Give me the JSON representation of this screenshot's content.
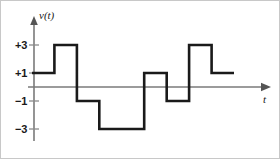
{
  "chart_data": {
    "type": "line",
    "subtype": "step-waveform",
    "title": "",
    "xlabel": "t",
    "ylabel": "v(t)",
    "y_tick_labels": [
      "+3",
      "+1",
      "−1",
      "−3"
    ],
    "y_tick_values": [
      3,
      1,
      -1,
      -3
    ],
    "ylim": [
      -4.2,
      4.2
    ],
    "xlim": [
      0,
      8.9
    ],
    "grid": false,
    "legend": null,
    "axis_style": "two-axis-arrows",
    "x_breakpoints": [
      0,
      1,
      2,
      3,
      4,
      5,
      6,
      7,
      8
    ],
    "values": [
      1,
      3,
      -1,
      -3,
      1,
      -1,
      3,
      1
    ],
    "series": [
      {
        "name": "v(t)",
        "color": "#1a1a1a",
        "steps": [
          {
            "x_start": 0,
            "x_end": 1,
            "y": 1
          },
          {
            "x_start": 1,
            "x_end": 2,
            "y": 3
          },
          {
            "x_start": 2,
            "x_end": 3,
            "y": -1
          },
          {
            "x_start": 3,
            "x_end": 5,
            "y": -3
          },
          {
            "x_start": 5,
            "x_end": 6,
            "y": 1
          },
          {
            "x_start": 6,
            "x_end": 7,
            "y": -1
          },
          {
            "x_start": 7,
            "x_end": 8,
            "y": 3
          },
          {
            "x_start": 8,
            "x_end": 9,
            "y": 1
          }
        ]
      }
    ]
  },
  "figure": {
    "ylabel": "v(t)",
    "xlabel": "t",
    "ticks": {
      "plus_three": "+3",
      "plus_one": "+1",
      "minus_one": "−1",
      "minus_three": "−3"
    },
    "colors": {
      "waveform": "#1a1a1a",
      "axis": "#7a7a7a",
      "border": "#c8c8c8",
      "background": "#ffffff"
    }
  }
}
